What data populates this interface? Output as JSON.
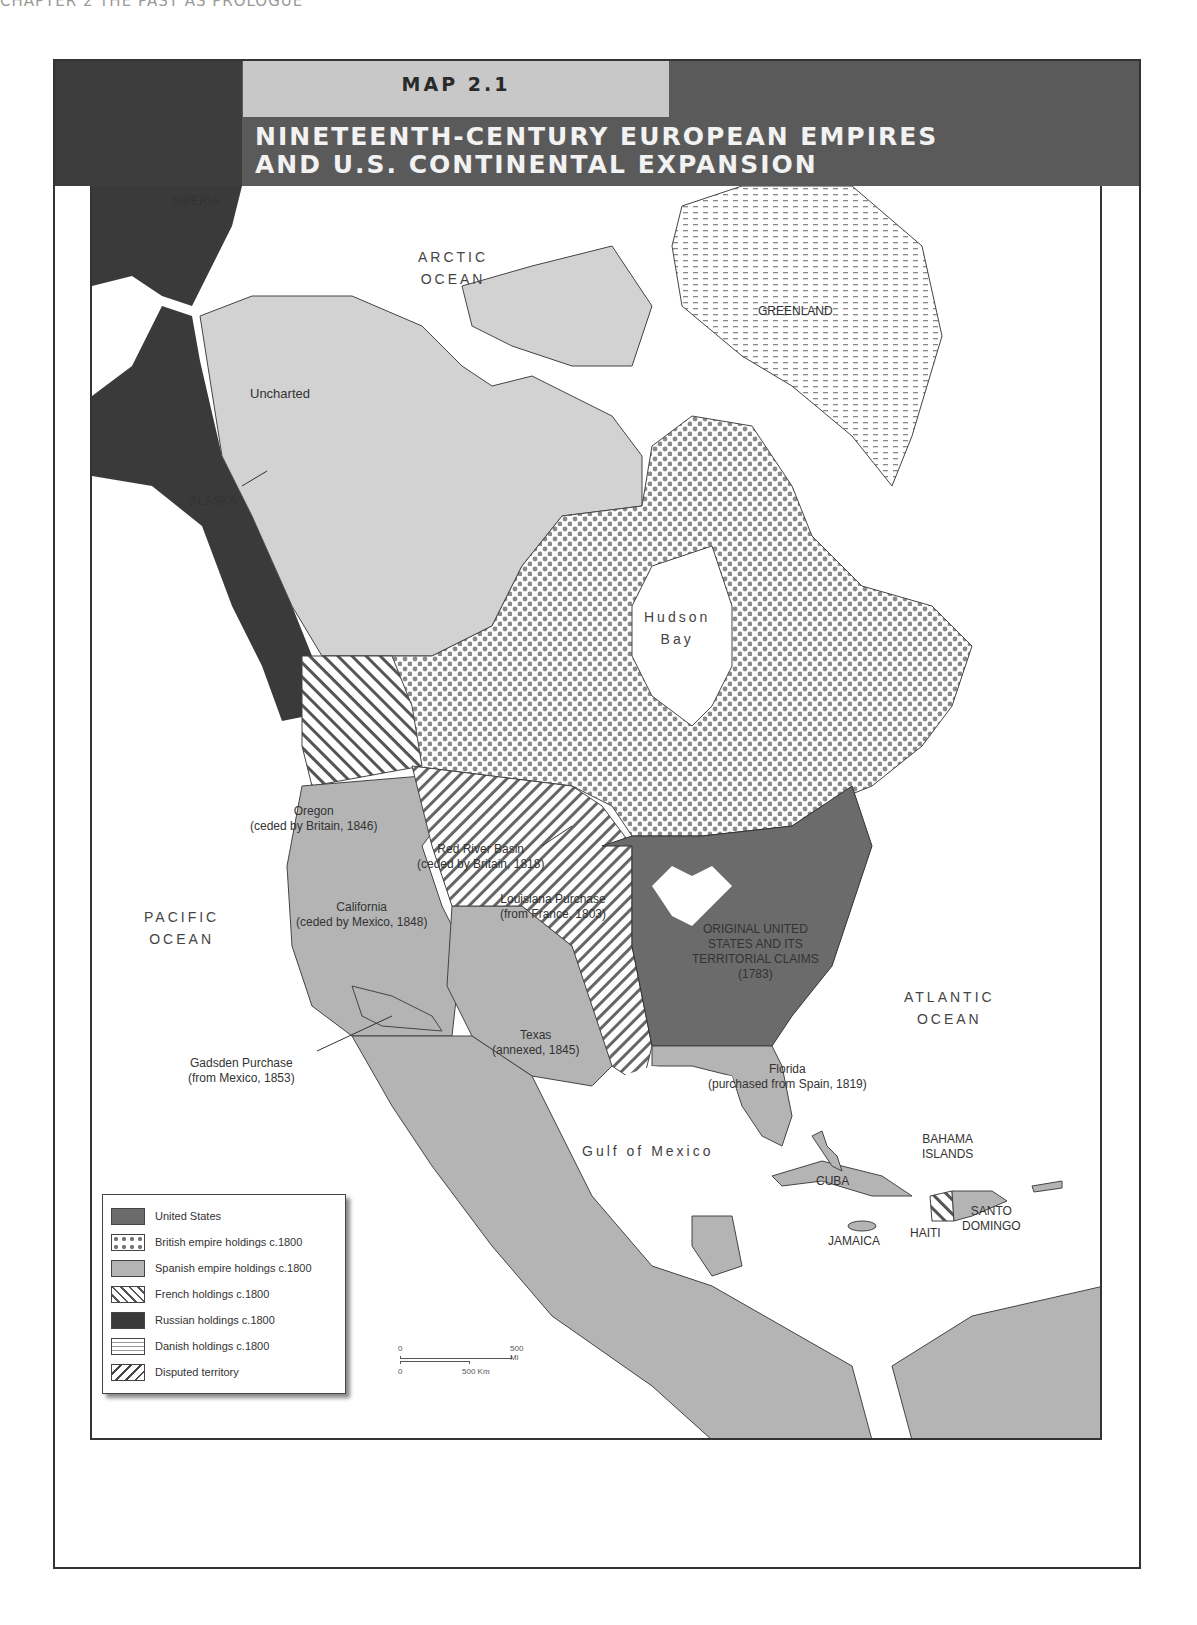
{
  "page": {
    "running_head": "CHAPTER 2   THE PAST AS PROLOGUE"
  },
  "header": {
    "map_number": "MAP 2.1",
    "title_line1": "NINETEENTH-CENTURY EUROPEAN EMPIRES",
    "title_line2": "AND U.S. CONTINENTAL EXPANSION"
  },
  "colors": {
    "header_dark": "#3d3d3d",
    "header_mid": "#5a5a5a",
    "map_number_box": "#c8c8c8",
    "united_states": "#6b6b6b",
    "british": "#a0a0a0",
    "spanish": "#b4b4b4",
    "french": "#ffffff",
    "russian": "#3a3a3a",
    "danish": "#ffffff",
    "uncharted": "#d2d2d2",
    "water": "#ffffff"
  },
  "map": {
    "oceans": {
      "arctic": [
        "ARCTIC",
        "OCEAN"
      ],
      "pacific": [
        "PACIFIC",
        "OCEAN"
      ],
      "atlantic": [
        "ATLANTIC",
        "OCEAN"
      ],
      "hudson": [
        "Hudson",
        "Bay"
      ],
      "gulf": "Gulf of Mexico"
    },
    "places": {
      "siberia": "SIBERIA",
      "greenland": "GREENLAND",
      "uncharted": "Uncharted",
      "alaska": "ALASKA",
      "bahama": [
        "BAHAMA",
        "ISLANDS"
      ],
      "cuba": "CUBA",
      "jamaica": "JAMAICA",
      "haiti": "HAITI",
      "santo_domingo": [
        "SANTO",
        "DOMINGO"
      ]
    },
    "territories": {
      "oregon": [
        "Oregon",
        "(ceded by Britain, 1846)"
      ],
      "red_river": [
        "Red River Basin",
        "(ceded by Britain, 1818)"
      ],
      "louisiana": [
        "Louisiana Purchase",
        "(from France, 1803)"
      ],
      "california": [
        "California",
        "(ceded by Mexico, 1848)"
      ],
      "original_us": [
        "ORIGINAL UNITED",
        "STATES AND ITS",
        "TERRITORIAL CLAIMS",
        "(1783)"
      ],
      "texas": [
        "Texas",
        "(annexed, 1845)"
      ],
      "gadsden": [
        "Gadsden Purchase",
        "(from Mexico, 1853)"
      ],
      "florida": [
        "Florida",
        "(purchased from Spain, 1819)"
      ]
    }
  },
  "legend": {
    "items": [
      {
        "label": "United States",
        "pattern": "solid-dark"
      },
      {
        "label": "British empire holdings c.1800",
        "pattern": "dots"
      },
      {
        "label": "Spanish empire holdings c.1800",
        "pattern": "solid-light"
      },
      {
        "label": "French holdings c.1800",
        "pattern": "hatch-backslash"
      },
      {
        "label": "Russian holdings c.1800",
        "pattern": "solid-darkest"
      },
      {
        "label": "Danish holdings c.1800",
        "pattern": "dashes"
      },
      {
        "label": "Disputed territory",
        "pattern": "hatch-slash"
      }
    ]
  },
  "scale_bar": {
    "mi_start": "0",
    "mi_end": "500 Mi",
    "km_start": "0",
    "km_end": "500 Km"
  }
}
